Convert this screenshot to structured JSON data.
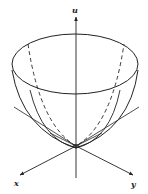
{
  "figure": {
    "type": "paraboloid-3d-sketch",
    "axes": {
      "vertical_label": "u",
      "left_label": "x",
      "right_label": "y"
    },
    "colors": {
      "stroke": "#222222",
      "background": "#ffffff"
    }
  }
}
